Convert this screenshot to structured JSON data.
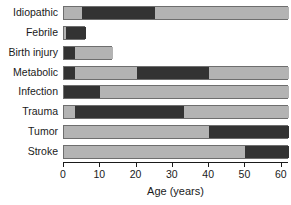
{
  "chart_data": {
    "type": "bar",
    "orientation": "horizontal",
    "stacked": true,
    "title": "",
    "subtitle": "",
    "xlabel": "Age (years)",
    "ylabel": "",
    "xlim": [
      0,
      62
    ],
    "xticks": [
      0,
      10,
      20,
      30,
      40,
      50,
      60
    ],
    "xtick_labels": [
      "0",
      "10",
      "20",
      "30",
      "40",
      "50",
      "60"
    ],
    "grid": false,
    "legend": "none",
    "categories": [
      "Idiopathic",
      "Febrile",
      "Birth injury",
      "Metabolic",
      "Infection",
      "Trauma",
      "Tumor",
      "Stroke"
    ],
    "colors": {
      "light": "#b3b3b3",
      "dark": "#333333",
      "outline": "#6e6e6e",
      "axis": "#1a1a1a",
      "background": "#ffffff"
    },
    "bars": [
      {
        "category": "Idiopathic",
        "total": 62,
        "segments": [
          {
            "start": 0,
            "end": 5,
            "shade": "light"
          },
          {
            "start": 5,
            "end": 25,
            "shade": "dark"
          },
          {
            "start": 25,
            "end": 62,
            "shade": "light"
          }
        ]
      },
      {
        "category": "Febrile",
        "total": 6,
        "segments": [
          {
            "start": 0,
            "end": 0.5,
            "shade": "light"
          },
          {
            "start": 0.5,
            "end": 6,
            "shade": "dark"
          }
        ]
      },
      {
        "category": "Birth injury",
        "total": 13.5,
        "segments": [
          {
            "start": 0,
            "end": 3,
            "shade": "dark"
          },
          {
            "start": 3,
            "end": 13.5,
            "shade": "light"
          }
        ]
      },
      {
        "category": "Metabolic",
        "total": 62,
        "segments": [
          {
            "start": 0,
            "end": 3,
            "shade": "dark"
          },
          {
            "start": 3,
            "end": 20,
            "shade": "light"
          },
          {
            "start": 20,
            "end": 40,
            "shade": "dark"
          },
          {
            "start": 40,
            "end": 62,
            "shade": "light"
          }
        ]
      },
      {
        "category": "Infection",
        "total": 62,
        "segments": [
          {
            "start": 0,
            "end": 10,
            "shade": "dark"
          },
          {
            "start": 10,
            "end": 62,
            "shade": "light"
          }
        ]
      },
      {
        "category": "Trauma",
        "total": 62,
        "segments": [
          {
            "start": 0,
            "end": 3,
            "shade": "light"
          },
          {
            "start": 3,
            "end": 33,
            "shade": "dark"
          },
          {
            "start": 33,
            "end": 62,
            "shade": "light"
          }
        ]
      },
      {
        "category": "Tumor",
        "total": 62,
        "segments": [
          {
            "start": 0,
            "end": 40,
            "shade": "light"
          },
          {
            "start": 40,
            "end": 62,
            "shade": "dark"
          }
        ]
      },
      {
        "category": "Stroke",
        "total": 62,
        "segments": [
          {
            "start": 0,
            "end": 50,
            "shade": "light"
          },
          {
            "start": 50,
            "end": 62,
            "shade": "dark"
          }
        ]
      }
    ]
  }
}
